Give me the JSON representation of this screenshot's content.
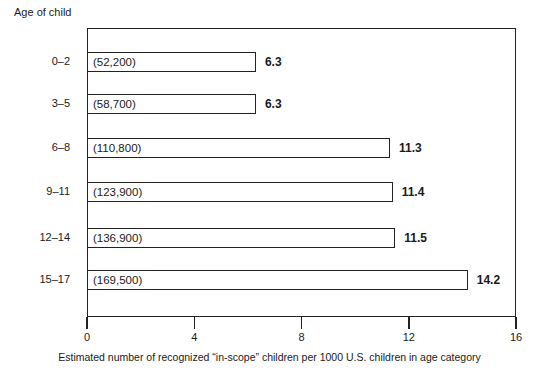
{
  "chart_data": {
    "type": "bar",
    "orientation": "horizontal",
    "title": "",
    "ylabel": "Age of child",
    "xlabel": "Estimated number of recognized “in-scope” children per 1000 U.S. children in age category",
    "xlim": [
      0,
      16
    ],
    "xticks": [
      0,
      4,
      8,
      12,
      16
    ],
    "grid": false,
    "categories": [
      "0–2",
      "3–5",
      "6–8",
      "9–11",
      "12–14",
      "15–17"
    ],
    "values": [
      6.3,
      6.3,
      11.3,
      11.4,
      11.5,
      14.2
    ],
    "counts": [
      52200,
      58700,
      110800,
      123900,
      136900,
      169500
    ],
    "bar_annotations": [
      "(52,200)",
      "(58,700)",
      "(110,800)",
      "(123,900)",
      "(136,900)",
      "(169,500)"
    ],
    "value_labels": [
      "6.3",
      "6.3",
      "11.3",
      "11.4",
      "11.5",
      "14.2"
    ],
    "tick_labels": [
      "0",
      "4",
      "8",
      "12",
      "16"
    ],
    "colors": {
      "bar_fill": "#ffffff",
      "bar_stroke": "#222222",
      "text": "#1a1a1a"
    }
  }
}
